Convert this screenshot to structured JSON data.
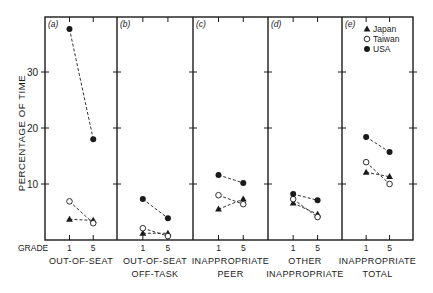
{
  "chart_data": {
    "type": "line",
    "title": "",
    "ylabel": "PERCENTAGE OF TIME",
    "xlabel": "GRADE",
    "ylim": [
      0,
      40
    ],
    "yticks": [
      10,
      20,
      30
    ],
    "grid": false,
    "legend_position": "top-right (inside panel e)",
    "x": [
      "1",
      "5"
    ],
    "panels": [
      {
        "tag": "(a)",
        "label_lines": [
          "OUT-OF-SEAT"
        ],
        "series": [
          {
            "name": "Japan",
            "values": [
              3.7,
              3.5
            ]
          },
          {
            "name": "Taiwan",
            "values": [
              6.9,
              3.0
            ]
          },
          {
            "name": "USA",
            "values": [
              37.7,
              18.0
            ]
          }
        ]
      },
      {
        "tag": "(b)",
        "label_lines": [
          "OUT-OF-SEAT",
          "OFF-TASK"
        ],
        "series": [
          {
            "name": "Japan",
            "values": [
              1.2,
              1.2
            ]
          },
          {
            "name": "Taiwan",
            "values": [
              2.1,
              0.7
            ]
          },
          {
            "name": "USA",
            "values": [
              7.3,
              3.9
            ]
          }
        ]
      },
      {
        "tag": "(c)",
        "label_lines": [
          "INAPPROPRIATE",
          "PEER"
        ],
        "series": [
          {
            "name": "Japan",
            "values": [
              5.5,
              7.3
            ]
          },
          {
            "name": "Taiwan",
            "values": [
              8.0,
              6.4
            ]
          },
          {
            "name": "USA",
            "values": [
              11.6,
              10.2
            ]
          }
        ]
      },
      {
        "tag": "(d)",
        "label_lines": [
          "OTHER",
          "INAPPROPRIATE"
        ],
        "series": [
          {
            "name": "Japan",
            "values": [
              6.6,
              4.6
            ]
          },
          {
            "name": "Taiwan",
            "values": [
              7.3,
              4.1
            ]
          },
          {
            "name": "USA",
            "values": [
              8.2,
              7.1
            ]
          }
        ]
      },
      {
        "tag": "(e)",
        "label_lines": [
          "INAPPROPRIATE",
          "TOTAL"
        ],
        "series": [
          {
            "name": "Japan",
            "values": [
              12.1,
              11.3
            ]
          },
          {
            "name": "Taiwan",
            "values": [
              13.9,
              10.0
            ]
          },
          {
            "name": "USA",
            "values": [
              18.4,
              15.7
            ]
          }
        ]
      }
    ],
    "legend": [
      {
        "name": "Japan",
        "marker": "filled-triangle"
      },
      {
        "name": "Taiwan",
        "marker": "open-circle"
      },
      {
        "name": "USA",
        "marker": "filled-circle"
      }
    ]
  },
  "colors": {
    "ink": "#1a1a1a",
    "background": "#ffffff"
  }
}
